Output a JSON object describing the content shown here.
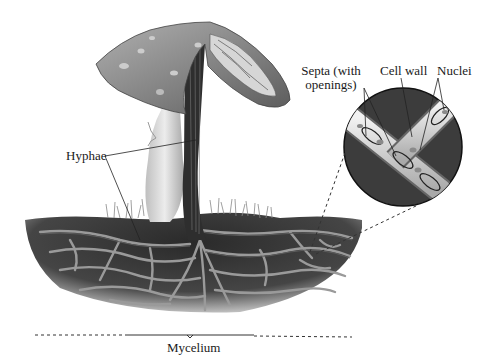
{
  "figure": {
    "labels": {
      "septa_line1": "Septa (with",
      "septa_line2": "openings)",
      "cell_wall": "Cell wall",
      "nuclei": "Nuclei",
      "hyphae": "Hyphae",
      "mycelium": "Mycelium"
    },
    "colors": {
      "background": "#ffffff",
      "soil_dark": "#2b2b2b",
      "soil_mid": "#4a4a4a",
      "hyphae_light": "#9a9a9a",
      "cap_gray": "#8c8c8c",
      "stalk_gray": "#d4d4d4",
      "inset_bg": "#3c3c3c",
      "label_text": "#1a1a1a"
    }
  }
}
